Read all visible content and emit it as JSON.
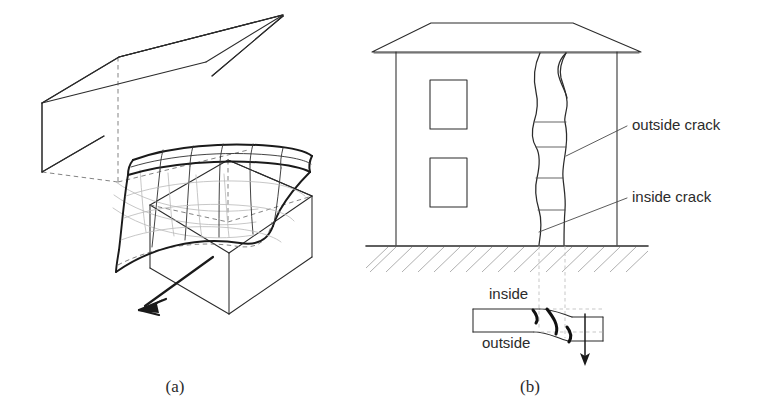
{
  "figure": {
    "background_color": "#ffffff",
    "ink_color": "#2b2b2b",
    "panels": [
      {
        "id": "a",
        "caption": "(a)",
        "subject": "Normal fault block model with curved rupture surface",
        "caption_x": 175,
        "caption_y": 392
      },
      {
        "id": "b",
        "caption": "(b)",
        "subject": "Two-storey building elevation with cracks and wall plan view",
        "caption_x": 530,
        "caption_y": 392
      }
    ]
  },
  "panel_a": {
    "name": "fault-block-model",
    "upper_block": {
      "name": "hanging-wall-block",
      "visible_outline": "M 42,103 L 119,57 L 285,15 L 285,15",
      "edges_solid": [
        "M 42,103 L 118,58 L 286,16 L 286,16",
        "M 42,103 L 42,178",
        "M 42,178 L 118,133",
        "M 118,58 L 118,133",
        "M 286,16 L 286,16"
      ],
      "edges_hidden": [
        "M 118,58 L 118,133",
        "M 118,133 L 286,92"
      ]
    },
    "lower_block": {
      "name": "footwall-block",
      "offset": "down-right"
    },
    "fault_surface": {
      "name": "curved-rupture-mesh",
      "description": "Curved saddle-shaped mesh surface with grid lines",
      "grid_columns": 6,
      "grid_rows": 4
    },
    "slip_arrow": {
      "name": "slip-direction-arrow",
      "direction": "down-left",
      "from": [
        212,
        258
      ],
      "to": [
        140,
        310
      ]
    }
  },
  "panel_b": {
    "name": "building-crack-elevation",
    "building": {
      "name": "two-storey-building",
      "wall_left": 395,
      "wall_right": 617,
      "wall_top": 51,
      "ground_y": 245,
      "roof": {
        "name": "hipped-roof",
        "apex_left_x": 431,
        "apex_right_x": 573,
        "apex_y": 23,
        "eave_left_x": 372,
        "eave_right_x": 640,
        "eave_y": 52
      },
      "windows": [
        {
          "name": "window-upper-left",
          "x": 430,
          "y": 80,
          "w": 36,
          "h": 48
        },
        {
          "name": "window-lower-left",
          "x": 430,
          "y": 158,
          "w": 36,
          "h": 48
        }
      ],
      "cracks": [
        {
          "name": "crack-inside-elevation",
          "side": "inside",
          "x_top": 537,
          "x_bottom": 538
        },
        {
          "name": "crack-outside-elevation",
          "side": "outside",
          "x_top": 567,
          "x_bottom": 565
        }
      ],
      "crack_segment_lines_y": [
        122,
        146,
        178,
        210
      ]
    },
    "ground": {
      "name": "ground-hatching",
      "line_y": 245,
      "hatch_bottom": 272,
      "hatch_angle_deg": 45
    },
    "labels": [
      {
        "name": "label-outside-crack",
        "text": "outside crack",
        "x": 632,
        "y": 129,
        "leader_from": [
          566,
          155
        ],
        "leader_to": [
          627,
          125
        ]
      },
      {
        "name": "label-inside-crack",
        "text": "inside crack",
        "x": 632,
        "y": 201,
        "leader_from": [
          539,
          232
        ],
        "leader_to": [
          627,
          197
        ]
      }
    ],
    "plan_view": {
      "name": "wall-plan-section",
      "label_inside": "inside",
      "label_outside": "outside",
      "inside_label_x": 489,
      "inside_label_y": 297,
      "outside_label_x": 485,
      "outside_label_y": 345,
      "rect_left": 473,
      "rect_right": 603,
      "rect_top": 308,
      "rect_bottom": 332,
      "offset_amount": 11,
      "settlement_arrow": {
        "name": "settlement-arrow",
        "direction": "down",
        "from": [
          585,
          315
        ],
        "to": [
          585,
          363
        ]
      }
    }
  }
}
